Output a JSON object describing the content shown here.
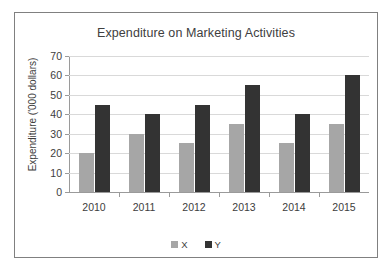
{
  "chart_data": {
    "type": "bar",
    "title": "Expenditure on Marketing Activities",
    "xlabel": "",
    "ylabel": "Expenditure ('000 dollars)",
    "categories": [
      "2010",
      "2011",
      "2012",
      "2013",
      "2014",
      "2015"
    ],
    "series": [
      {
        "name": "X",
        "color": "#a6a6a6",
        "values": [
          20,
          30,
          25,
          35,
          25,
          35
        ]
      },
      {
        "name": "Y",
        "color": "#333333",
        "values": [
          45,
          40,
          45,
          55,
          40,
          60
        ]
      }
    ],
    "ylim": [
      0,
      70
    ],
    "yticks": [
      0,
      10,
      20,
      30,
      40,
      50,
      60,
      70
    ],
    "ytick_labels": [
      "0",
      "10",
      "20",
      "30",
      "40",
      "50",
      "60",
      "70"
    ],
    "grid": true,
    "legend_position": "bottom",
    "legend_entries": [
      "X",
      "Y"
    ]
  }
}
